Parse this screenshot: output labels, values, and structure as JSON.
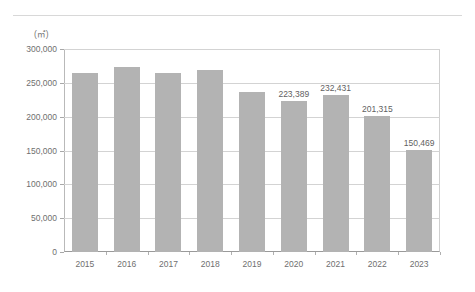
{
  "page": {
    "background_color": "#ffffff",
    "rule_color": "#d8d8d8"
  },
  "chart_data": {
    "type": "bar",
    "title": "",
    "subtitle": "",
    "xlabel": "",
    "ylabel": "",
    "unit_label": "(㎡)",
    "categories": [
      "2015",
      "2016",
      "2017",
      "2018",
      "2019",
      "2020",
      "2021",
      "2022",
      "2023"
    ],
    "values": [
      265000,
      273000,
      264000,
      269000,
      236000,
      223389,
      232431,
      201315,
      150469
    ],
    "data_labels": [
      "",
      "",
      "",
      "",
      "",
      "223,389",
      "232,431",
      "201,315",
      "150,469"
    ],
    "ylim": [
      0,
      300000
    ],
    "yticks": [
      0,
      50000,
      100000,
      150000,
      200000,
      250000,
      300000
    ],
    "ytick_labels": [
      "0",
      "50,000",
      "100,000",
      "150,000",
      "200,000",
      "250,000",
      "300,000"
    ],
    "grid": true,
    "legend": false,
    "bar_color": "#b3b3b3",
    "grid_color": "#d3d3d3",
    "axis_color": "#9a9a9a"
  }
}
